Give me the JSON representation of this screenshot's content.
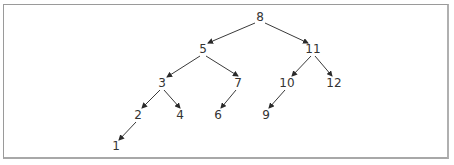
{
  "diagram": {
    "type": "binary-search-tree",
    "nodes": [
      {
        "id": "n8",
        "label": "8",
        "x": 260,
        "y": 17
      },
      {
        "id": "n5",
        "label": "5",
        "x": 203,
        "y": 49
      },
      {
        "id": "n11",
        "label": "11",
        "x": 313,
        "y": 49
      },
      {
        "id": "n3",
        "label": "3",
        "x": 162,
        "y": 83
      },
      {
        "id": "n7",
        "label": "7",
        "x": 238,
        "y": 83
      },
      {
        "id": "n10",
        "label": "10",
        "x": 287,
        "y": 83
      },
      {
        "id": "n12",
        "label": "12",
        "x": 334,
        "y": 83
      },
      {
        "id": "n2",
        "label": "2",
        "x": 138,
        "y": 115
      },
      {
        "id": "n4",
        "label": "4",
        "x": 180,
        "y": 115
      },
      {
        "id": "n6",
        "label": "6",
        "x": 218,
        "y": 115
      },
      {
        "id": "n9",
        "label": "9",
        "x": 266,
        "y": 115
      },
      {
        "id": "n1",
        "label": "1",
        "x": 116,
        "y": 146
      }
    ],
    "edges": [
      {
        "from": "8",
        "to": "5"
      },
      {
        "from": "8",
        "to": "11"
      },
      {
        "from": "5",
        "to": "3"
      },
      {
        "from": "5",
        "to": "7"
      },
      {
        "from": "11",
        "to": "10"
      },
      {
        "from": "11",
        "to": "12"
      },
      {
        "from": "3",
        "to": "2"
      },
      {
        "from": "3",
        "to": "4"
      },
      {
        "from": "7",
        "to": "6"
      },
      {
        "from": "10",
        "to": "9"
      },
      {
        "from": "2",
        "to": "1"
      }
    ],
    "colors": {
      "edge": "#3a3a3a",
      "text": "#333333",
      "border": "#9a9a9a",
      "background": "#ffffff"
    }
  }
}
